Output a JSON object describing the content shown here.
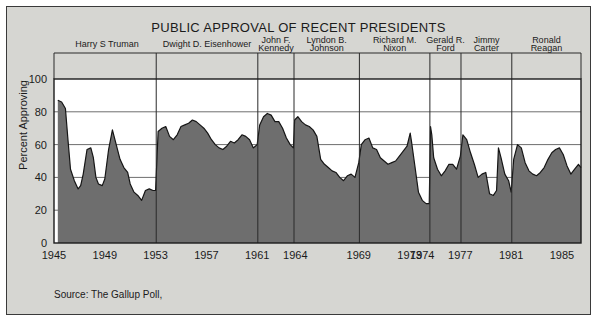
{
  "figure": {
    "title": "PUBLIC APPROVAL OF RECENT PRESIDENTS",
    "source": "Source: The Gallup Poll,",
    "ylabel": "Percent Approving",
    "background": "#d6d6d2",
    "fill_color": "#6e6e6e",
    "border_color": "#3a3a3a"
  },
  "chart_data": {
    "type": "area",
    "title": "PUBLIC APPROVAL OF RECENT PRESIDENTS",
    "subtitle": "",
    "xlabel": "",
    "ylabel": "Percent Approving",
    "xlim": [
      1945,
      1986.5
    ],
    "ylim": [
      0,
      100
    ],
    "yticks": [
      0,
      20,
      40,
      60,
      80,
      100
    ],
    "xticks": [
      1945,
      1949,
      1953,
      1957,
      1961,
      1964,
      1969,
      1973,
      1974,
      1977,
      1981,
      1985
    ],
    "grid": true,
    "legend": "none",
    "annotations": [
      "Source: The Gallup Poll,"
    ],
    "presidents": [
      {
        "name_line1": "Harry S Truman",
        "name_line2": "",
        "start": 1945.3,
        "end": 1953.05
      },
      {
        "name_line1": "Dwight D. Eisenhower",
        "name_line2": "",
        "start": 1953.05,
        "end": 1961.05
      },
      {
        "name_line1": "John F.",
        "name_line2": "Kennedy",
        "start": 1961.05,
        "end": 1963.9
      },
      {
        "name_line1": "Lyndon B.",
        "name_line2": "Johnson",
        "start": 1963.9,
        "end": 1969.05
      },
      {
        "name_line1": "Richard M.",
        "name_line2": "Nixon",
        "start": 1969.05,
        "end": 1974.6
      },
      {
        "name_line1": "Gerald R.",
        "name_line2": "Ford",
        "start": 1974.6,
        "end": 1977.05
      },
      {
        "name_line1": "Jimmy",
        "name_line2": "Carter",
        "start": 1977.05,
        "end": 1981.05
      },
      {
        "name_line1": "Ronald",
        "name_line2": "Reagan",
        "start": 1981.05,
        "end": 1986.5
      }
    ],
    "series_name": "Percent Approving",
    "x": [
      1945.3,
      1945.6,
      1945.9,
      1946.1,
      1946.3,
      1946.6,
      1946.9,
      1947.1,
      1947.3,
      1947.6,
      1947.9,
      1948.1,
      1948.3,
      1948.5,
      1948.8,
      1949.0,
      1949.3,
      1949.6,
      1949.9,
      1950.2,
      1950.5,
      1950.8,
      1951.0,
      1951.3,
      1951.6,
      1951.9,
      1952.2,
      1952.5,
      1952.8,
      1953.0,
      1953.2,
      1953.5,
      1953.8,
      1954.1,
      1954.4,
      1954.7,
      1955.0,
      1955.3,
      1955.6,
      1955.9,
      1956.2,
      1956.5,
      1956.8,
      1957.1,
      1957.4,
      1957.7,
      1958.0,
      1958.3,
      1958.6,
      1958.9,
      1959.2,
      1959.5,
      1959.8,
      1960.1,
      1960.4,
      1960.7,
      1961.0,
      1961.2,
      1961.5,
      1961.8,
      1962.1,
      1962.4,
      1962.7,
      1963.0,
      1963.3,
      1963.6,
      1963.85,
      1963.95,
      1964.2,
      1964.5,
      1964.8,
      1965.1,
      1965.4,
      1965.7,
      1966.0,
      1966.3,
      1966.6,
      1966.9,
      1967.2,
      1967.5,
      1967.8,
      1968.1,
      1968.4,
      1968.7,
      1969.0,
      1969.2,
      1969.5,
      1969.8,
      1970.1,
      1970.4,
      1970.7,
      1971.0,
      1971.3,
      1971.6,
      1971.9,
      1972.2,
      1972.5,
      1972.8,
      1973.05,
      1973.15,
      1973.4,
      1973.7,
      1974.0,
      1974.3,
      1974.55,
      1974.65,
      1974.75,
      1974.9,
      1975.2,
      1975.5,
      1975.8,
      1976.1,
      1976.4,
      1976.7,
      1977.0,
      1977.2,
      1977.5,
      1977.8,
      1978.1,
      1978.4,
      1978.7,
      1979.0,
      1979.3,
      1979.6,
      1979.85,
      1980.0,
      1980.2,
      1980.5,
      1980.8,
      1981.0,
      1981.2,
      1981.5,
      1981.8,
      1982.1,
      1982.4,
      1982.7,
      1983.0,
      1983.3,
      1983.6,
      1983.9,
      1984.2,
      1984.5,
      1984.8,
      1985.1,
      1985.4,
      1985.7,
      1986.0,
      1986.3,
      1986.5
    ],
    "y": [
      87,
      86,
      82,
      63,
      45,
      38,
      33,
      35,
      42,
      57,
      58,
      52,
      40,
      36,
      35,
      39,
      57,
      69,
      60,
      51,
      46,
      43,
      36,
      31,
      29,
      26,
      32,
      33,
      32,
      32,
      68,
      70,
      71,
      65,
      63,
      66,
      71,
      72,
      73,
      75,
      74,
      72,
      70,
      67,
      63,
      60,
      58,
      57,
      59,
      62,
      61,
      63,
      66,
      65,
      63,
      58,
      60,
      72,
      77,
      79,
      78,
      74,
      74,
      70,
      64,
      60,
      58,
      75,
      77,
      74,
      72,
      71,
      69,
      65,
      51,
      48,
      46,
      44,
      43,
      40,
      38,
      41,
      42,
      40,
      49,
      60,
      63,
      64,
      58,
      57,
      52,
      50,
      48,
      49,
      50,
      53,
      56,
      59,
      67,
      62,
      48,
      31,
      26,
      24,
      24,
      71,
      66,
      52,
      45,
      41,
      44,
      48,
      48,
      45,
      53,
      66,
      63,
      55,
      48,
      40,
      42,
      43,
      30,
      29,
      32,
      58,
      52,
      42,
      38,
      31,
      51,
      60,
      58,
      49,
      44,
      42,
      41,
      43,
      46,
      51,
      55,
      57,
      58,
      54,
      47,
      42,
      45,
      48,
      46
    ]
  }
}
